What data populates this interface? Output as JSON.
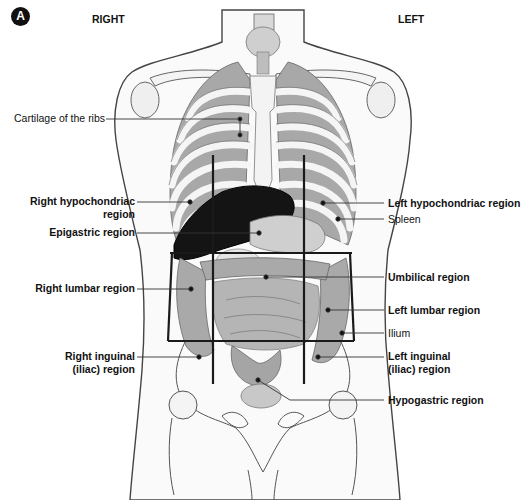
{
  "figure": {
    "panel_letter": "A",
    "side_labels": {
      "right": "RIGHT",
      "left": "LEFT"
    },
    "left_labels": [
      {
        "id": "cartilage",
        "text": "Cartilage of the ribs",
        "bold": false
      },
      {
        "id": "right-hypochondriac",
        "text_line1": "Right hypochondriac",
        "text_line2": "region",
        "bold": true
      },
      {
        "id": "epigastric",
        "text": "Epigastric region",
        "bold": true
      },
      {
        "id": "right-lumbar",
        "text": "Right lumbar region",
        "bold": true
      },
      {
        "id": "right-inguinal",
        "text_line1": "Right inguinal",
        "text_line2": "(iliac) region",
        "bold": true
      }
    ],
    "right_labels": [
      {
        "id": "left-hypochondriac",
        "text": "Left hypochondriac region",
        "bold": true
      },
      {
        "id": "spleen",
        "text": "Spleen",
        "bold": false
      },
      {
        "id": "umbilical",
        "text": "Umbilical region",
        "bold": true
      },
      {
        "id": "left-lumbar",
        "text": "Left lumbar region",
        "bold": true
      },
      {
        "id": "ilium",
        "text": "Ilium",
        "bold": false
      },
      {
        "id": "left-inguinal",
        "text_line1": "Left inguinal",
        "text_line2": "(iliac) region",
        "bold": true
      },
      {
        "id": "hypogastric",
        "text": "Hypogastric region",
        "bold": true
      }
    ],
    "grid": {
      "vertical_x": [
        213,
        304
      ],
      "horizontal_y": [
        253,
        341
      ],
      "color": "#1a1a1a"
    },
    "colors": {
      "outline": "#333333",
      "bone": "#f2f2f2",
      "organ": "#9a9a9a",
      "liver": "#141414",
      "muscle": "#8a8a8a"
    }
  }
}
